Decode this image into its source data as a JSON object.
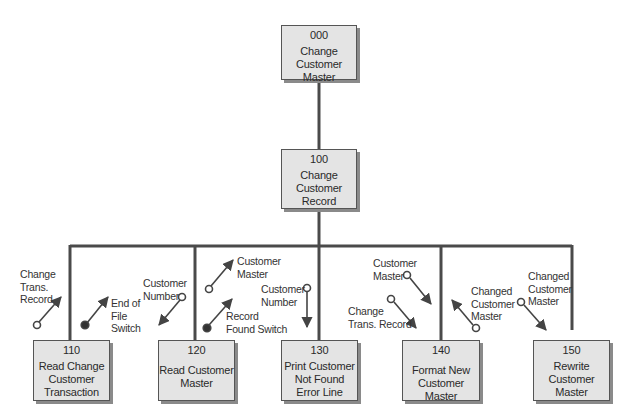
{
  "diagram": {
    "type": "structure-chart",
    "modules": [
      {
        "id": "000",
        "name": "Change\nCustomer\nMaster",
        "level": 0
      },
      {
        "id": "100",
        "name": "Change\nCustomer\nRecord",
        "level": 1,
        "parent": "000"
      },
      {
        "id": "110",
        "name": "Read Change\nCustomer\nTransaction",
        "level": 2,
        "parent": "100"
      },
      {
        "id": "120",
        "name": "Read Customer\nMaster",
        "level": 2,
        "parent": "100"
      },
      {
        "id": "130",
        "name": "Print Customer\nNot Found\nError Line",
        "level": 2,
        "parent": "100"
      },
      {
        "id": "140",
        "name": "Format New\nCustomer Master",
        "level": 2,
        "parent": "100"
      },
      {
        "id": "150",
        "name": "Rewrite\nCustomer\nMaster",
        "level": 2,
        "parent": "100"
      }
    ],
    "couples": [
      {
        "label": "Change\nTrans.\nRecord",
        "kind": "data",
        "module": "110",
        "direction": "up"
      },
      {
        "label": "End of\nFile\nSwitch",
        "kind": "control",
        "module": "110",
        "direction": "up"
      },
      {
        "label": "Customer\nNumber",
        "kind": "data",
        "module": "120",
        "direction": "down"
      },
      {
        "label": "Customer\nMaster",
        "kind": "data",
        "module": "120",
        "direction": "up"
      },
      {
        "label": "Record\nFound Switch",
        "kind": "control",
        "module": "120",
        "direction": "up"
      },
      {
        "label": "Customer\nNumber",
        "kind": "data",
        "module": "130",
        "direction": "down"
      },
      {
        "label": "Customer\nMaster",
        "kind": "data",
        "module": "140",
        "direction": "down"
      },
      {
        "label": "Change\nTrans. Record",
        "kind": "data",
        "module": "140",
        "direction": "down"
      },
      {
        "label": "Changed\nCustomer\nMaster",
        "kind": "data",
        "module": "140",
        "direction": "up"
      },
      {
        "label": "Changed\nCustomer\nMaster",
        "kind": "data",
        "module": "150",
        "direction": "down"
      }
    ],
    "colors": {
      "box_fill": "#e4e4e4",
      "box_border": "#555555",
      "shadow": "#8a8a8a",
      "line": "#444444"
    }
  }
}
